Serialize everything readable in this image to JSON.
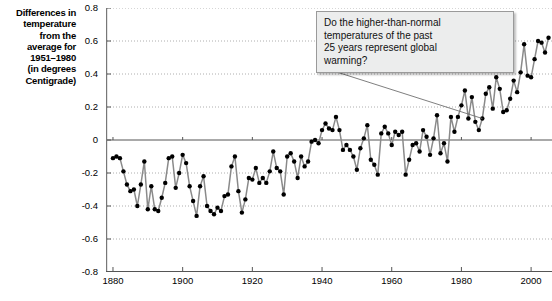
{
  "chart_data": {
    "type": "line",
    "title": "",
    "subtitle": "",
    "xlabel": "",
    "ylabel": "Differences in temperature from the average for 1951-1980 (in degrees Centigrade)",
    "ylabel_lines": [
      "Differences in",
      "temperature",
      "from the",
      "average for",
      "1951–1980",
      "(in degrees",
      "Centigrade)"
    ],
    "xlim": [
      1878,
      2006
    ],
    "ylim": [
      -0.8,
      0.8
    ],
    "yticks": [
      0.8,
      0.6,
      0.4,
      0.2,
      0,
      -0.2,
      -0.4,
      -0.6,
      -0.8
    ],
    "ytick_labels": [
      "0.8",
      "0.6",
      "0.4",
      "0.2",
      "0",
      "-0.2",
      "-0.4",
      "-0.6",
      "-0.8"
    ],
    "xticks": [
      1880,
      1900,
      1920,
      1940,
      1960,
      1980,
      2000
    ],
    "xtick_labels": [
      "1880",
      "1900",
      "1920",
      "1940",
      "1960",
      "1980",
      "2000"
    ],
    "grid": "horizontal-dotted",
    "zero_line": true,
    "legend": "none",
    "line_color": "#8a8a8a",
    "marker_color": "#000000",
    "series": [
      {
        "name": "Global temperature anomaly",
        "x": [
          1880,
          1881,
          1882,
          1883,
          1884,
          1885,
          1886,
          1887,
          1888,
          1889,
          1890,
          1891,
          1892,
          1893,
          1894,
          1895,
          1896,
          1897,
          1898,
          1899,
          1900,
          1901,
          1902,
          1903,
          1904,
          1905,
          1906,
          1907,
          1908,
          1909,
          1910,
          1911,
          1912,
          1913,
          1914,
          1915,
          1916,
          1917,
          1918,
          1919,
          1920,
          1921,
          1922,
          1923,
          1924,
          1925,
          1926,
          1927,
          1928,
          1929,
          1930,
          1931,
          1932,
          1933,
          1934,
          1935,
          1936,
          1937,
          1938,
          1939,
          1940,
          1941,
          1942,
          1943,
          1944,
          1945,
          1946,
          1947,
          1948,
          1949,
          1950,
          1951,
          1952,
          1953,
          1954,
          1955,
          1956,
          1957,
          1958,
          1959,
          1960,
          1961,
          1962,
          1963,
          1964,
          1965,
          1966,
          1967,
          1968,
          1969,
          1970,
          1971,
          1972,
          1973,
          1974,
          1975,
          1976,
          1977,
          1978,
          1979,
          1980,
          1981,
          1982,
          1983,
          1984,
          1985,
          1986,
          1987,
          1988,
          1989,
          1990,
          1991,
          1992,
          1993,
          1994,
          1995,
          1996,
          1997,
          1998,
          1999,
          2000,
          2001,
          2002,
          2003,
          2004,
          2005
        ],
        "values": [
          -0.11,
          -0.1,
          -0.11,
          -0.19,
          -0.27,
          -0.31,
          -0.3,
          -0.4,
          -0.27,
          -0.13,
          -0.42,
          -0.28,
          -0.42,
          -0.43,
          -0.35,
          -0.26,
          -0.11,
          -0.1,
          -0.29,
          -0.2,
          -0.09,
          -0.14,
          -0.28,
          -0.37,
          -0.46,
          -0.28,
          -0.22,
          -0.4,
          -0.43,
          -0.45,
          -0.41,
          -0.43,
          -0.34,
          -0.33,
          -0.16,
          -0.1,
          -0.31,
          -0.44,
          -0.36,
          -0.23,
          -0.24,
          -0.17,
          -0.26,
          -0.23,
          -0.26,
          -0.19,
          -0.07,
          -0.17,
          -0.19,
          -0.33,
          -0.1,
          -0.08,
          -0.13,
          -0.23,
          -0.1,
          -0.16,
          -0.13,
          -0.01,
          0.0,
          -0.02,
          0.06,
          0.1,
          0.07,
          0.06,
          0.14,
          0.06,
          -0.06,
          -0.03,
          -0.06,
          -0.1,
          -0.18,
          -0.05,
          0.01,
          0.09,
          -0.12,
          -0.15,
          -0.21,
          0.04,
          0.08,
          0.04,
          -0.03,
          0.05,
          0.03,
          0.05,
          -0.21,
          -0.12,
          -0.03,
          -0.02,
          -0.07,
          0.06,
          0.02,
          -0.09,
          0.01,
          0.15,
          -0.08,
          -0.02,
          -0.13,
          0.14,
          0.05,
          0.14,
          0.21,
          0.3,
          0.13,
          0.26,
          0.11,
          0.06,
          0.13,
          0.28,
          0.32,
          0.19,
          0.38,
          0.31,
          0.17,
          0.18,
          0.25,
          0.36,
          0.29,
          0.41,
          0.58,
          0.39,
          0.38,
          0.49,
          0.6,
          0.59,
          0.53,
          0.62
        ]
      }
    ],
    "annotations": [
      {
        "name": "global-warming-question",
        "text": "Do the higher-than-normal temperatures of the past 25 years represent global warming?",
        "lines": [
          "Do the higher-than-normal",
          "temperatures of the past",
          "25 years represent global",
          "warming?"
        ],
        "leader_target_year": 1986,
        "leader_target_value": 0.13
      }
    ]
  }
}
